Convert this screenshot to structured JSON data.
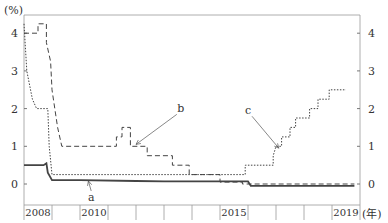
{
  "chart_data": {
    "type": "line",
    "title": "",
    "ylabel": "(%)",
    "xlabel": "(年)",
    "ylim": [
      -0.5,
      4.4
    ],
    "xlim": [
      2008,
      2020
    ],
    "yticks": [
      0,
      1,
      2,
      3,
      4
    ],
    "x_tick_labels": [
      {
        "year": 2008,
        "label": "2008"
      },
      {
        "year": 2010,
        "label": "2010"
      },
      {
        "year": 2015,
        "label": "2015"
      },
      {
        "year": 2019,
        "label": "2019"
      }
    ],
    "dual_y_axis": true,
    "grid": false,
    "legend": "inline annotations a, b, c",
    "series": [
      {
        "name": "a",
        "style": "solid",
        "points": [
          [
            2008.0,
            0.5
          ],
          [
            2008.7,
            0.5
          ],
          [
            2008.8,
            0.55
          ],
          [
            2008.85,
            0.3
          ],
          [
            2009.0,
            0.1
          ],
          [
            2010.0,
            0.1
          ],
          [
            2012.0,
            0.08
          ],
          [
            2013.0,
            0.07
          ],
          [
            2014.0,
            0.07
          ],
          [
            2015.0,
            0.07
          ],
          [
            2016.0,
            0.07
          ],
          [
            2016.1,
            -0.05
          ],
          [
            2019.8,
            -0.05
          ]
        ]
      },
      {
        "name": "b",
        "style": "dashed",
        "points": [
          [
            2008.0,
            4.0
          ],
          [
            2008.5,
            4.0
          ],
          [
            2008.5,
            4.25
          ],
          [
            2008.8,
            4.25
          ],
          [
            2008.8,
            3.75
          ],
          [
            2008.95,
            3.25
          ],
          [
            2009.0,
            2.5
          ],
          [
            2009.1,
            2.0
          ],
          [
            2009.2,
            1.5
          ],
          [
            2009.35,
            1.0
          ],
          [
            2011.3,
            1.0
          ],
          [
            2011.3,
            1.25
          ],
          [
            2011.5,
            1.25
          ],
          [
            2011.5,
            1.5
          ],
          [
            2011.8,
            1.5
          ],
          [
            2011.8,
            1.0
          ],
          [
            2012.4,
            1.0
          ],
          [
            2012.4,
            0.75
          ],
          [
            2013.3,
            0.75
          ],
          [
            2013.3,
            0.5
          ],
          [
            2013.9,
            0.5
          ],
          [
            2013.9,
            0.25
          ],
          [
            2015.0,
            0.25
          ],
          [
            2015.0,
            0.05
          ],
          [
            2015.8,
            0.05
          ],
          [
            2015.8,
            0.0
          ],
          [
            2019.8,
            0.0
          ]
        ]
      },
      {
        "name": "c",
        "style": "dotted",
        "points": [
          [
            2008.0,
            4.25
          ],
          [
            2008.1,
            3.0
          ],
          [
            2008.3,
            2.25
          ],
          [
            2008.45,
            2.0
          ],
          [
            2008.85,
            2.0
          ],
          [
            2008.9,
            1.0
          ],
          [
            2009.0,
            0.25
          ],
          [
            2015.9,
            0.25
          ],
          [
            2015.9,
            0.5
          ],
          [
            2016.9,
            0.5
          ],
          [
            2016.9,
            0.75
          ],
          [
            2017.0,
            1.0
          ],
          [
            2017.2,
            1.0
          ],
          [
            2017.2,
            1.25
          ],
          [
            2017.5,
            1.25
          ],
          [
            2017.5,
            1.5
          ],
          [
            2017.7,
            1.5
          ],
          [
            2017.7,
            1.75
          ],
          [
            2018.2,
            1.75
          ],
          [
            2018.2,
            2.0
          ],
          [
            2018.5,
            2.0
          ],
          [
            2018.5,
            2.25
          ],
          [
            2018.9,
            2.25
          ],
          [
            2018.9,
            2.5
          ],
          [
            2019.5,
            2.5
          ]
        ]
      }
    ],
    "annotations": [
      {
        "text": "a",
        "x": 2010.4,
        "y": -0.45,
        "arrow_to": [
          2010.3,
          0.08
        ]
      },
      {
        "text": "b",
        "x": 2013.6,
        "y": 1.9,
        "arrow_to": [
          2012.0,
          1.05
        ]
      },
      {
        "text": "c",
        "x": 2016.0,
        "y": 1.85,
        "arrow_to": [
          2017.1,
          0.95
        ]
      }
    ]
  }
}
